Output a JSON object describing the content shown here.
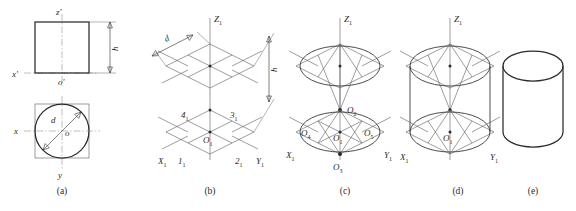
{
  "figure": {
    "panel_count": 5,
    "line_color": "#2b2b2b",
    "axis_color": "#8a8a8a",
    "background": "#ffffff"
  },
  "panels": [
    {
      "id": "a",
      "caption": "(a)",
      "description": "Orthographic views: front view square with height h, top view circle of diameter d",
      "labels": {
        "z_prime": "z'",
        "x_prime": "x'",
        "o_prime": "o'",
        "x": "x",
        "y": "y",
        "o": "o",
        "d": "d",
        "h": "h"
      }
    },
    {
      "id": "b",
      "caption": "(b)",
      "description": "Isometric axes with two rhombuses (circumscribing squares) separated by height h",
      "labels": {
        "z1": "Z",
        "z1_sub": "1",
        "x1": "X",
        "x1_sub": "1",
        "y1": "Y",
        "y1_sub": "1",
        "o1": "O",
        "o1_sub": "1",
        "p1": "1",
        "p1_sub": "1",
        "p2": "2",
        "p2_sub": "1",
        "p3": "3",
        "p3_sub": "1",
        "p4": "4",
        "p4_sub": "1",
        "d": "d",
        "h": "h"
      }
    },
    {
      "id": "c",
      "caption": "(c)",
      "description": "Four-center method: arc centers O2, O3, O4, O5 located on the rhombus",
      "labels": {
        "z1": "Z",
        "z1_sub": "1",
        "x1": "X",
        "x1_sub": "1",
        "y1": "Y",
        "y1_sub": "1",
        "o1": "O",
        "o1_sub": "1",
        "o2": "O",
        "o2_sub": "2",
        "o3": "O",
        "o3_sub": "3",
        "o4": "O",
        "o4_sub": "4",
        "o5": "O",
        "o5_sub": "5"
      }
    },
    {
      "id": "d",
      "caption": "(d)",
      "description": "Both approximate ellipses drawn, joined by vertical tangent outlines",
      "labels": {
        "z1": "Z",
        "z1_sub": "1",
        "x1": "X",
        "x1_sub": "1",
        "y1": "Y",
        "y1_sub": "1",
        "o1": "O",
        "o1_sub": "1"
      }
    },
    {
      "id": "e",
      "caption": "(e)",
      "description": "Finished isometric cylinder after removing construction lines",
      "labels": {}
    }
  ]
}
